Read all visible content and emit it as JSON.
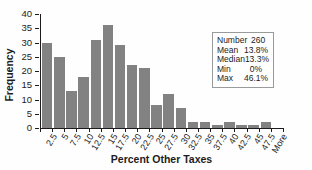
{
  "chart_data": {
    "type": "bar",
    "title": "",
    "categories": [
      "2.5",
      "5",
      "7.5",
      "10",
      "12.5",
      "15",
      "17.5",
      "20",
      "22.5",
      "25",
      "27.5",
      "30",
      "32.5",
      "35",
      "37.5",
      "40",
      "42.5",
      "45",
      "47.5",
      "More"
    ],
    "values": [
      30,
      25,
      13,
      18,
      31,
      36,
      29,
      22,
      21,
      8,
      12,
      7,
      2,
      2,
      1,
      2,
      1,
      1,
      2,
      0
    ],
    "xlabel": "Percent Other Taxes",
    "ylabel": "Frequency",
    "ylim": [
      0,
      40
    ],
    "yticks": [
      0,
      5,
      10,
      15,
      20,
      25,
      30,
      35,
      40
    ],
    "grid": false,
    "legend": "none",
    "bar_color": "#828282",
    "axis_color": "#1c1c1c",
    "stats_box": {
      "rows": [
        {
          "label": "Number",
          "value": "260"
        },
        {
          "label": "Mean",
          "value": "13.8%"
        },
        {
          "label": "Median",
          "value": "13.3%"
        },
        {
          "label": "Min",
          "value": "0%"
        },
        {
          "label": "Max",
          "value": "46.1%"
        }
      ]
    }
  }
}
